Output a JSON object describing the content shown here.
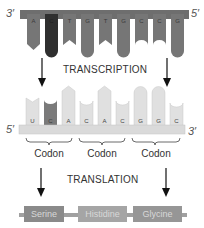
{
  "dna": {
    "left_end": "3′",
    "right_end": "5′",
    "bases": [
      "A",
      "C",
      "T",
      "G",
      "T",
      "G",
      "C",
      "C",
      "G"
    ],
    "backbone_color": "#6e6e6e",
    "base_color": "#6e6e6e",
    "highlight_color": "#2f2f2f"
  },
  "process1": {
    "label": "TRANSCRIPTION"
  },
  "mrna": {
    "left_end": "5′",
    "right_end": "3′",
    "bases": [
      "U",
      "C",
      "A",
      "C",
      "A",
      "C",
      "G",
      "G",
      "C"
    ],
    "backbone_color": "#dadada",
    "base_color": "#e0e0e0",
    "highlight_color": "#7a7a7a"
  },
  "codons": [
    {
      "label": "Codon"
    },
    {
      "label": "Codon"
    },
    {
      "label": "Codon"
    }
  ],
  "process2": {
    "label": "TRANSLATION"
  },
  "protein": {
    "amino_acids": [
      {
        "label": "Serine",
        "color": "#8a8a8a"
      },
      {
        "label": "Histidine",
        "color": "#a5a5a5"
      },
      {
        "label": "Glycine",
        "color": "#969696"
      }
    ]
  }
}
